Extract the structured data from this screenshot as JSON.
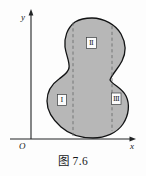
{
  "figure": {
    "caption": "图 7.6",
    "axes": {
      "y_label": "y",
      "x_label": "x",
      "origin_label": "O",
      "axis_color": "#222426"
    },
    "region": {
      "fill_color": "#b7b7b7",
      "outline_color": "#121314",
      "divider_color": "#6d6f71",
      "divider_style": "dashed"
    },
    "labels": [
      {
        "name": "region-label-1",
        "text": "Ⅰ"
      },
      {
        "name": "region-label-2",
        "text": "Ⅱ"
      },
      {
        "name": "region-label-3",
        "text": "Ⅲ"
      }
    ]
  }
}
